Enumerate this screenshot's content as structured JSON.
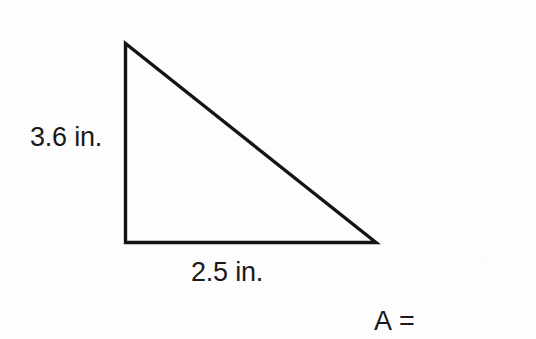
{
  "figure": {
    "name": "right-triangle",
    "shape": "right triangle",
    "stroke_color": "#141414",
    "background_color": "#fdfdfd",
    "text_color": "#1a1a1a",
    "vertices": {
      "apex": [
        124,
        42
      ],
      "bottom_left": [
        124,
        242
      ],
      "bottom_right": [
        377,
        242
      ]
    },
    "stroke_width": 3.4
  },
  "labels": {
    "height": "3.6 in.",
    "base": "2.5 in.",
    "area_prompt": "A ="
  },
  "measurements": {
    "height_value": 3.6,
    "base_value": 2.5,
    "unit": "in."
  }
}
